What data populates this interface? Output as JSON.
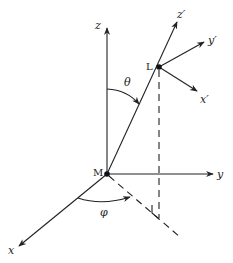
{
  "diagram": {
    "type": "3d-coordinate-frames",
    "points": {
      "origin": {
        "label": "M"
      },
      "point": {
        "label": "L"
      }
    },
    "axes": {
      "x": "x",
      "y": "y",
      "z": "z",
      "x_prime": "x′",
      "y_prime": "y′",
      "z_prime": "z′"
    },
    "angles": {
      "polar": "θ",
      "azimuth": "φ"
    },
    "colors": {
      "stroke": "#222222",
      "background": "#ffffff"
    }
  }
}
